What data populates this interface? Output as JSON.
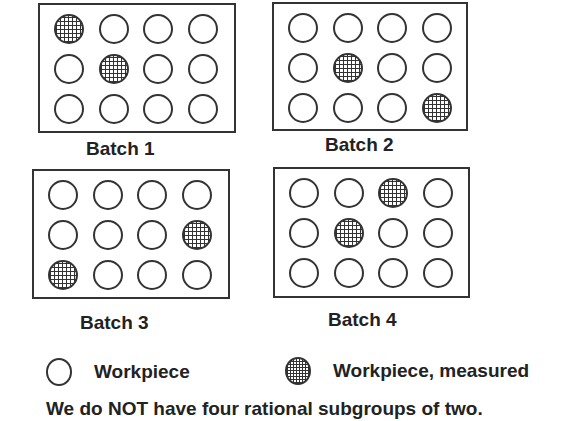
{
  "diagram": {
    "batches": [
      {
        "label": "Batch 1",
        "rows": 3,
        "cols": 4,
        "measured": [
          [
            0,
            0
          ],
          [
            1,
            1
          ]
        ]
      },
      {
        "label": "Batch 2",
        "rows": 3,
        "cols": 4,
        "measured": [
          [
            1,
            1
          ],
          [
            2,
            3
          ]
        ]
      },
      {
        "label": "Batch 3",
        "rows": 3,
        "cols": 4,
        "measured": [
          [
            1,
            3
          ],
          [
            2,
            0
          ]
        ]
      },
      {
        "label": "Batch 4",
        "rows": 3,
        "cols": 4,
        "measured": [
          [
            0,
            2
          ],
          [
            1,
            1
          ]
        ]
      }
    ],
    "legend": {
      "workpiece": "Workpiece",
      "workpiece_measured": "Workpiece, measured"
    },
    "conclusion": "We do NOT have four rational subgroups of two."
  }
}
